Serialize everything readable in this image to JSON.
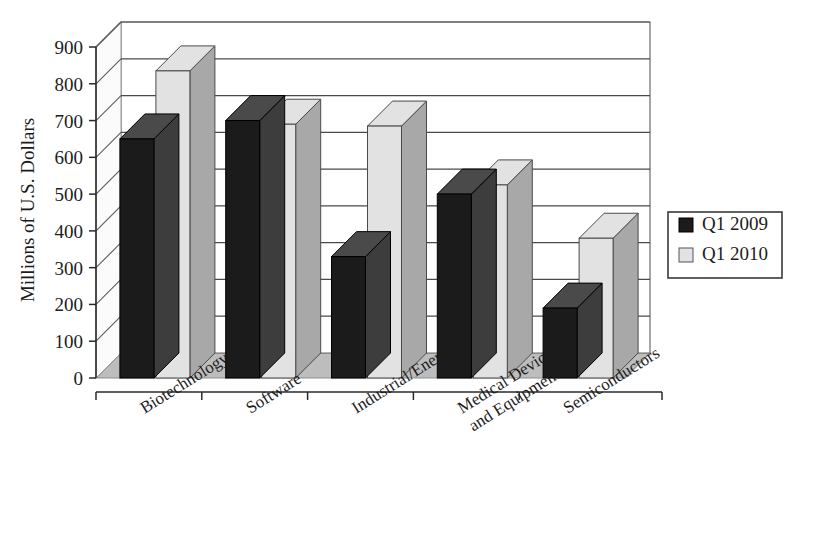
{
  "chart_data": {
    "type": "bar",
    "title": "",
    "xlabel": "",
    "ylabel": "Millions of U.S. Dollars",
    "ylim": [
      0,
      900
    ],
    "yticks": [
      0,
      100,
      200,
      300,
      400,
      500,
      600,
      700,
      800,
      900
    ],
    "ytick_labels": [
      "0",
      "100",
      "200",
      "300",
      "400",
      "500",
      "600",
      "700",
      "800",
      "900"
    ],
    "grid": true,
    "legend_position": "right",
    "style": "3d-grouped-columns",
    "categories": [
      "Biotechnology",
      "Software",
      "Industrial/Energy",
      "Medical Devices\nand Equipment",
      "Semiconductors"
    ],
    "category_lines": [
      [
        "Biotechnology"
      ],
      [
        "Software"
      ],
      [
        "Industrial/Energy"
      ],
      [
        "Medical Devices",
        "and Equipment"
      ],
      [
        "Semiconductors"
      ]
    ],
    "series": [
      {
        "name": "Q1 2009",
        "color": "#1b1b1b",
        "values": [
          650,
          700,
          330,
          500,
          190
        ]
      },
      {
        "name": "Q1 2010",
        "color": "#e2e2e2",
        "values": [
          835,
          690,
          685,
          525,
          380
        ]
      }
    ]
  },
  "legend": {
    "entries": [
      {
        "label": "Q1 2009",
        "swatch": "dark-square-icon"
      },
      {
        "label": "Q1 2010",
        "swatch": "light-square-icon"
      }
    ]
  },
  "colors": {
    "series_q1_2009": "#1b1b1b",
    "series_q1_2010": "#e2e2e2",
    "bar_side_dark": "#3d3d3d",
    "bar_side_light": "#a8a8a8",
    "floor": "#bdbdbd",
    "floor_edge": "#8d8d8d",
    "gridline": "#4a4a4a",
    "background": "#ffffff"
  }
}
